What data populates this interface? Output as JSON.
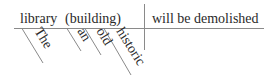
{
  "diagram": {
    "type": "sentence-diagram",
    "sentence": "The library (building) will be demolished",
    "subject": "library",
    "subject_appositive": "(building)",
    "predicate": "will be demolished",
    "modifiers": [
      "The",
      "an",
      "old",
      "historic"
    ],
    "colors": {
      "text": "#2a2a2a",
      "lines": "#8a8a8a",
      "background": "#ffffff"
    }
  }
}
